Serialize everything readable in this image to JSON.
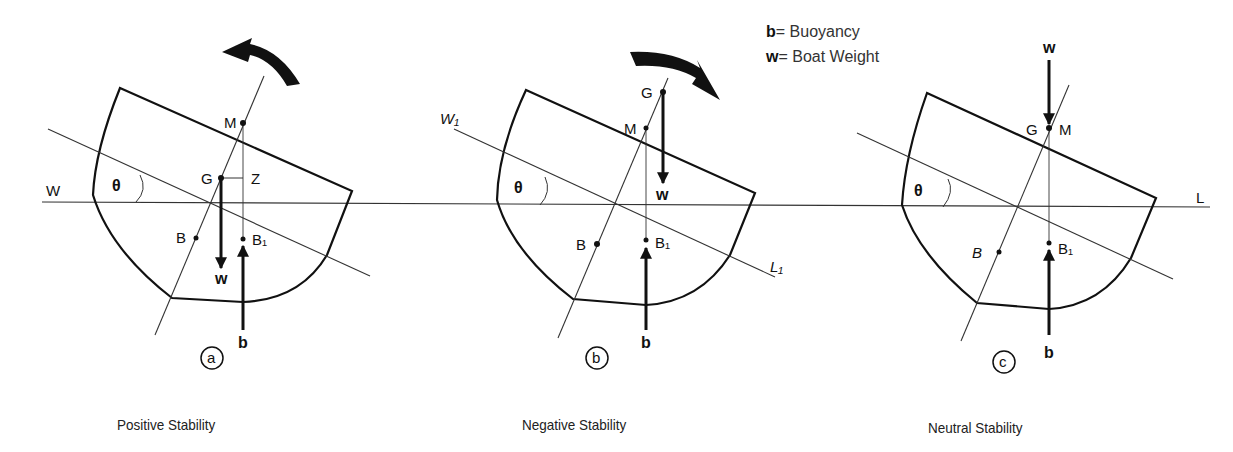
{
  "legend": {
    "items": [
      {
        "symbol": "b",
        "sep": "=",
        "meaning": "Buoyancy"
      },
      {
        "symbol": "w",
        "sep": "=",
        "meaning": "Boat Weight"
      }
    ]
  },
  "waterline": {
    "left_label": "W",
    "right_label": "L"
  },
  "panels": [
    {
      "id": "a",
      "caption": "Positive Stability",
      "angle_symbol": "θ",
      "points": {
        "M": "M",
        "G": "G",
        "Z": "Z",
        "B": "B",
        "B1": "B₁"
      },
      "forces": {
        "weight": "w",
        "buoyancy": "b"
      },
      "heel_arrow": "counter-clockwise (righting)"
    },
    {
      "id": "b",
      "caption": "Negative Stability",
      "angle_symbol": "θ",
      "inclined_waterline": {
        "left_label": "W₁",
        "right_label": "L₁"
      },
      "points": {
        "G": "G",
        "M": "M",
        "B": "B",
        "B1": "B₁"
      },
      "forces": {
        "weight": "w",
        "buoyancy": "b"
      },
      "heel_arrow": "clockwise (capsizing)"
    },
    {
      "id": "c",
      "caption": "Neutral Stability",
      "angle_symbol": "θ",
      "points": {
        "G": "G",
        "M": "M",
        "B": "B",
        "B1": "B₁"
      },
      "forces": {
        "weight": "w",
        "buoyancy": "b"
      }
    }
  ]
}
